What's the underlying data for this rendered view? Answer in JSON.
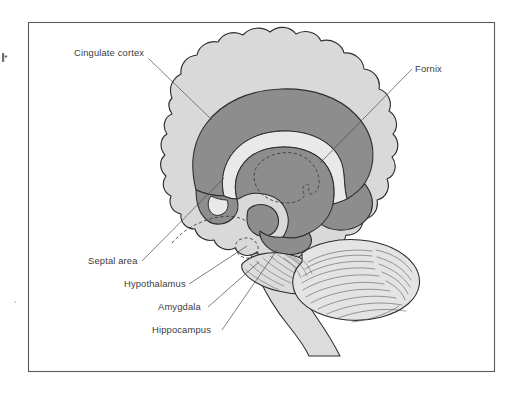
{
  "figure": {
    "title": "Limbic system — midsagittal brain diagram",
    "frame": {
      "x": 28,
      "y": 22,
      "width": 467,
      "height": 350,
      "border_color": "#5a5a5a",
      "background_color": "#ffffff"
    },
    "palette": {
      "page_background": "#ffffff",
      "cerebrum_fill": "#d9d9d9",
      "limbic_band_fill": "#8d8d8d",
      "corpus_callosum_fill": "#e9e9e9",
      "cerebellum_fill": "#e4e4e4",
      "outline_stroke": "#2e2e2e",
      "leader_line": "#4a4a4a",
      "label_text": "#3b3b3b"
    }
  },
  "labels": [
    {
      "id": "cingulate-cortex",
      "text": "Cingulate cortex",
      "text_x": 74,
      "text_y": 56,
      "anchor": "start",
      "leader": "M 148.5,58.5 L 212,120"
    },
    {
      "id": "fornix",
      "text": "Fornix",
      "text_x": 415,
      "text_y": 72,
      "anchor": "start",
      "leader": "M 412,69 L 320,163"
    },
    {
      "id": "septal-area",
      "text": "Septal area",
      "text_x": 88,
      "text_y": 264,
      "anchor": "start",
      "leader": "M 142,261 L 224,178"
    },
    {
      "id": "hypothalamus",
      "text": "Hypothalamus",
      "text_x": 124,
      "text_y": 287,
      "anchor": "start",
      "leader": "M 189,284 L 247,246"
    },
    {
      "id": "amygdala",
      "text": "Amygdala",
      "text_x": 158,
      "text_y": 310,
      "anchor": "start",
      "leader": "M 208,307 L 259,262"
    },
    {
      "id": "hippocampus",
      "text": "Hippocampus",
      "text_x": 152,
      "text_y": 333,
      "anchor": "start",
      "leader": "M 222,330 L 277,250"
    }
  ],
  "structures": [
    {
      "id": "cerebrum",
      "name": "Cerebrum (cerebral cortex)",
      "fill": "#d9d9d9"
    },
    {
      "id": "cingulate-band",
      "name": "Cingulate cortex band",
      "fill": "#8d8d8d"
    },
    {
      "id": "corpus-callosum",
      "name": "Corpus callosum",
      "fill": "#e9e9e9"
    },
    {
      "id": "fornix-band",
      "name": "Fornix",
      "fill": "#8d8d8d"
    },
    {
      "id": "thalamus",
      "name": "Thalamus (dashed outline)",
      "fill": "none"
    },
    {
      "id": "hypothalamus-region",
      "name": "Hypothalamus",
      "fill": "#dcdcdc"
    },
    {
      "id": "amygdala-region",
      "name": "Amygdala",
      "fill": "#dcdcdc"
    },
    {
      "id": "hippocampus-region",
      "name": "Hippocampus",
      "fill": "#dcdcdc"
    },
    {
      "id": "cerebellum",
      "name": "Cerebellum",
      "fill": "#e4e4e4"
    },
    {
      "id": "brainstem",
      "name": "Brainstem / spinal cord",
      "fill": "#dcdcdc"
    }
  ]
}
